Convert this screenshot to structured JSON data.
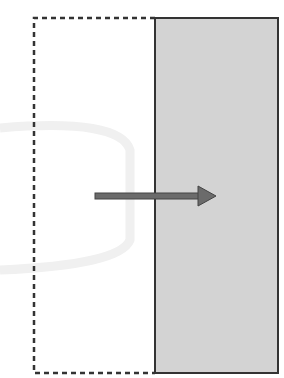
{
  "diagram": {
    "type": "shift-right",
    "colors": {
      "background": "#ffffff",
      "panel_fill": "#d3d3d3",
      "stroke": "#333333",
      "arrow_fill": "#6b6b6b",
      "watermark": "#f0f0f0"
    },
    "shapes": {
      "original_outline": {
        "x": 34,
        "y": 18,
        "w": 244,
        "h": 355,
        "style": "dashed"
      },
      "shifted_panel": {
        "x": 155,
        "y": 18,
        "w": 123,
        "h": 355,
        "style": "solid"
      },
      "arrow": {
        "x1": 95,
        "x2": 216,
        "y": 196,
        "direction": "right"
      }
    }
  }
}
